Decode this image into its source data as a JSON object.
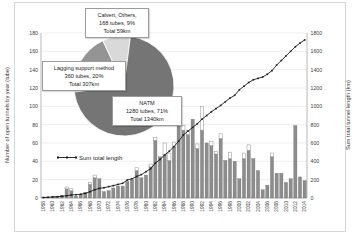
{
  "colors": {
    "bar_gray": "#8c8c8c",
    "bar_gray_stroke": "#6e6e6e",
    "bar_white": "#ffffff",
    "bar_white_stroke": "#8f8f8f",
    "line": "#1a1a1a",
    "grid": "#e3e3e3",
    "axis": "#a6a6a6",
    "tick_text": "#404040",
    "pie_natm": "#757575",
    "pie_lagging": "#949494",
    "pie_calvert": "#d9d9d9"
  },
  "chart_data": {
    "type": "bar",
    "title": "",
    "left_axis": {
      "label": "Number of open tunnels by year (tube)",
      "min": 0,
      "max": 180,
      "step": 20,
      "ticks": [
        0,
        20,
        40,
        60,
        80,
        100,
        120,
        140,
        160,
        180
      ]
    },
    "right_axis": {
      "label": "Sum total tunnel length (km)",
      "min": 0,
      "max": 1800,
      "step": 200,
      "ticks": [
        0,
        200,
        400,
        600,
        800,
        1000,
        1200,
        1400,
        1600,
        1800
      ]
    },
    "x_axis": {
      "tick_labels": [
        "1958",
        "1960",
        "1962",
        "1964",
        "1966",
        "1968",
        "1970",
        "1972",
        "1974",
        "1976",
        "1978",
        "1980",
        "1982",
        "1984",
        "1986",
        "1988",
        "1990",
        "1992",
        "1994",
        "1996",
        "1998",
        "2000",
        "2002",
        "2004",
        "2006",
        "2008",
        "2010",
        "2012",
        "2014"
      ]
    },
    "years": [
      1958,
      1959,
      1960,
      1961,
      1962,
      1963,
      1964,
      1965,
      1966,
      1967,
      1968,
      1969,
      1970,
      1971,
      1972,
      1973,
      1974,
      1975,
      1976,
      1977,
      1978,
      1979,
      1980,
      1981,
      1982,
      1983,
      1984,
      1985,
      1986,
      1987,
      1988,
      1989,
      1990,
      1991,
      1992,
      1993,
      1994,
      1995,
      1996,
      1997,
      1998,
      1999,
      2000,
      2001,
      2002,
      2003,
      2004,
      2005,
      2006,
      2007,
      2008,
      2009,
      2010,
      2011,
      2012,
      2013,
      2014
    ],
    "bars": {
      "series": [
        {
          "name": "open-tunnels-gray",
          "values": [
            1,
            1,
            2,
            2,
            3,
            10,
            8,
            2,
            4,
            6,
            15,
            22,
            21,
            7,
            8,
            11,
            13,
            13,
            18,
            20,
            30,
            22,
            25,
            34,
            63,
            45,
            47,
            41,
            56,
            85,
            74,
            69,
            86,
            54,
            74,
            60,
            57,
            48,
            65,
            41,
            43,
            40,
            21,
            43,
            52,
            43,
            30,
            9,
            14,
            45,
            27,
            27,
            17,
            21,
            79,
            23,
            19
          ]
        },
        {
          "name": "open-tunnels-white-top",
          "values": [
            0,
            0,
            0,
            0,
            0,
            2,
            2,
            0,
            0,
            0,
            2,
            3,
            0,
            0,
            0,
            0,
            0,
            0,
            0,
            0,
            3,
            0,
            0,
            3,
            3,
            0,
            13,
            8,
            5,
            3,
            5,
            5,
            0,
            5,
            26,
            0,
            5,
            3,
            5,
            0,
            7,
            0,
            0,
            6,
            6,
            0,
            0,
            0,
            0,
            4,
            0,
            0,
            0,
            0,
            0,
            0,
            0
          ]
        }
      ]
    },
    "line": {
      "name": "Sum total length",
      "values_km": [
        5,
        8,
        11,
        14,
        18,
        25,
        33,
        36,
        41,
        50,
        69,
        90,
        105,
        112,
        124,
        135,
        148,
        160,
        196,
        210,
        235,
        255,
        287,
        320,
        380,
        420,
        470,
        510,
        560,
        620,
        687,
        730,
        770,
        810,
        860,
        900,
        940,
        975,
        1010,
        1050,
        1090,
        1120,
        1180,
        1220,
        1260,
        1290,
        1305,
        1320,
        1350,
        1390,
        1450,
        1500,
        1550,
        1600,
        1650,
        1690,
        1724
      ]
    },
    "legend": {
      "label": "Sum total length",
      "position": "inside-left"
    },
    "pie": {
      "start_angle_deg": -97,
      "slices": [
        {
          "name": "lagging-support-method",
          "percent": 20,
          "color_key": "pie_lagging",
          "label_lines": [
            "Lagging support method",
            "360 tubes, 20%",
            "Total 307km"
          ]
        },
        {
          "name": "calvert-others",
          "percent": 9,
          "color_key": "pie_calvert",
          "label_lines": [
            "Calvert, Others,",
            "168 tubes, 9%",
            "Total 59km"
          ]
        },
        {
          "name": "natm",
          "percent": 71,
          "color_key": "pie_natm",
          "label_lines": [
            "NATM",
            "1280 tubes, 71%",
            "Total 1340km"
          ]
        }
      ]
    }
  }
}
